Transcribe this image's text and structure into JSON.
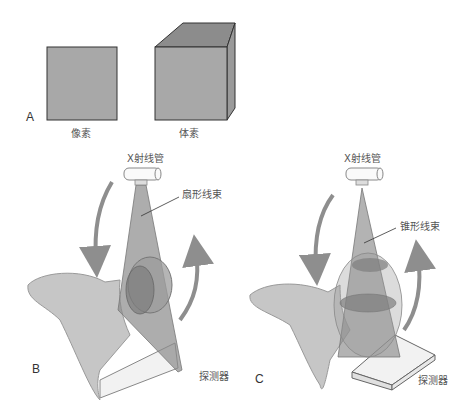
{
  "panels": {
    "A": {
      "letter": "A",
      "pixel_label": "像素",
      "voxel_label": "体素"
    },
    "B": {
      "letter": "B",
      "tube_label": "X射线管",
      "beam_label": "扇形线束",
      "detector_label": "探测器"
    },
    "C": {
      "letter": "C",
      "tube_label": "X射线管",
      "beam_label": "锥形线束",
      "detector_label": "探测器"
    }
  },
  "colors": {
    "square_fill": "#a8a8a8",
    "cube_top": "#8c8c8c",
    "cube_side": "#9a9a9a",
    "outline": "#333333",
    "jaw": "#c8c8c8",
    "beam": "#8a8a8a",
    "arrow": "#8e8e8e",
    "detector": "#f0f0f0"
  }
}
